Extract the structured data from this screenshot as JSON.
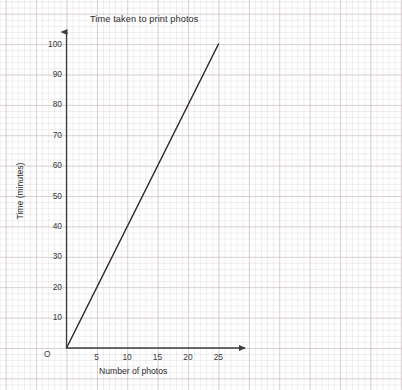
{
  "chart_data": {
    "type": "line",
    "title": "Time taken to print photos",
    "xlabel": "Number of photos",
    "ylabel": "Time (minutes)",
    "origin_label": "O",
    "xlim": [
      0,
      29
    ],
    "ylim": [
      0,
      105
    ],
    "xticks": [
      5,
      10,
      15,
      20,
      25
    ],
    "yticks": [
      10,
      20,
      30,
      40,
      50,
      60,
      70,
      80,
      90,
      100
    ],
    "xtick_labels": [
      "5",
      "10",
      "15",
      "20",
      "25"
    ],
    "ytick_labels": [
      "10",
      "20",
      "30",
      "40",
      "50",
      "60",
      "70",
      "80",
      "90",
      "100"
    ],
    "grid": true,
    "grid_major_step_x": 5,
    "grid_major_step_y": 10,
    "grid_minor_step_x": 1,
    "grid_minor_step_y": 2,
    "legend": null,
    "axis_arrows": true,
    "series": [
      {
        "name": "Printing time",
        "type": "line",
        "color": "#2e2e2e",
        "x": [
          0,
          25
        ],
        "y": [
          0,
          100
        ],
        "slope_minutes_per_photo": 4
      }
    ],
    "annotations": []
  },
  "colors": {
    "axis": "#3d3d3d",
    "line": "#2e2e2e",
    "grid_major": "#cebcc4",
    "grid_minor": "#c8c3c8",
    "text": "#2b2b2b",
    "background": "#ffffff"
  },
  "cropped_header_text": ""
}
